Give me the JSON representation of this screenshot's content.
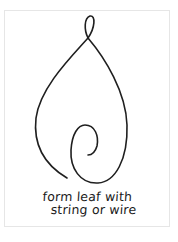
{
  "illustration": {
    "subject": "wire leaf outline with top loop and inner spiral",
    "stroke_color": "#1f1f1f",
    "background_color": "#ffffff",
    "border_color": "#e6e6e6"
  },
  "caption": {
    "line1": "form leaf with",
    "line2": "string or wire"
  }
}
